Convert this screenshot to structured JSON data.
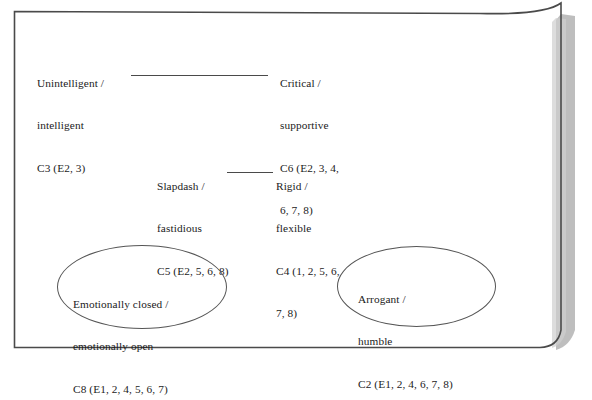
{
  "page": {
    "background_color": "#ffffff",
    "border_color": "#4a4a4a",
    "shadow_color": "#a9a9a9"
  },
  "diagram": {
    "type": "repertory-grid-construct-map",
    "nodes": [
      {
        "id": "c3",
        "construct": "C3",
        "pole_negative": "Unintelligent",
        "pole_positive": "intelligent",
        "elements": "(E2, 3)",
        "lines": [
          "Unintelligent /",
          "intelligent",
          "C3 (E2, 3)"
        ]
      },
      {
        "id": "c6",
        "construct": "C6",
        "pole_negative": "Critical",
        "pole_positive": "supportive",
        "elements": "(E2, 3, 4, 6, 7, 8)",
        "lines": [
          "Critical /",
          "supportive",
          "C6 (E2, 3, 4,",
          "6, 7, 8)"
        ]
      },
      {
        "id": "c5",
        "construct": "C5",
        "pole_negative": "Slapdash",
        "pole_positive": "fastidious",
        "elements": "(E2, 5, 6, 8)",
        "lines": [
          "Slapdash /",
          "fastidious",
          "C5 (E2, 5, 6, 8)"
        ]
      },
      {
        "id": "c4",
        "construct": "C4",
        "pole_negative": "Rigid",
        "pole_positive": "flexible",
        "elements": "(1, 2, 5, 6, 7, 8)",
        "lines": [
          "Rigid /",
          "flexible",
          "C4 (1, 2, 5, 6,",
          "7, 8)"
        ]
      }
    ],
    "ellipses": [
      {
        "id": "c8",
        "construct": "C8",
        "pole_negative": "Emotionally closed",
        "pole_positive": "emotionally open",
        "elements": "(E1, 2, 4, 5, 6, 7)",
        "lines": [
          "Emotionally closed /",
          "emotionally open",
          "C8 (E1, 2, 4, 5, 6, 7)"
        ]
      },
      {
        "id": "c2",
        "construct": "C2",
        "pole_negative": "Arrogant",
        "pole_positive": "humble",
        "elements": "(E1, 2, 4, 6, 7, 8)",
        "lines": [
          "Arrogant /",
          "humble",
          "C2 (E1, 2, 4, 6, 7, 8)"
        ]
      }
    ],
    "connectors": [
      {
        "id": "connector-top",
        "from": "c3",
        "to": "c6"
      },
      {
        "id": "connector-mid",
        "from": "c5",
        "to": "c4"
      }
    ]
  }
}
